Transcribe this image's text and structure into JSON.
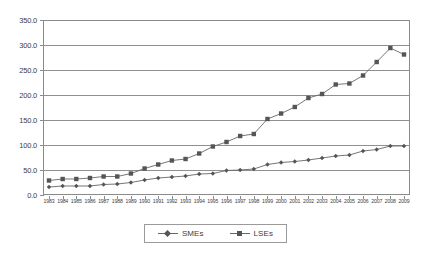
{
  "chart_data": {
    "type": "line",
    "title": "",
    "subtitle": "",
    "xlabel": "",
    "ylabel": "",
    "ylim": [
      0,
      350
    ],
    "y_ticks": [
      0,
      50,
      100,
      150,
      200,
      250,
      300,
      350
    ],
    "y_tick_labels": [
      "0.0",
      "50.0",
      "100.0",
      "150.0",
      "200.0",
      "250.0",
      "300.0",
      "350.0"
    ],
    "grid": "horizontal",
    "legend_position": "bottom-center",
    "categories": [
      "1983",
      "1984",
      "1985",
      "1986",
      "1987",
      "1988",
      "1989",
      "1990",
      "1991",
      "1992",
      "1993",
      "1994",
      "1995",
      "1996",
      "1997",
      "1998",
      "1999",
      "2000",
      "2001",
      "2002",
      "2003",
      "2004",
      "2005",
      "2006",
      "2007",
      "2008",
      "2009"
    ],
    "series": [
      {
        "name": "SMEs",
        "marker": "diamond",
        "color": "#555555",
        "values": [
          16,
          18,
          18,
          18,
          21,
          22,
          25,
          30,
          34,
          36,
          38,
          42,
          43,
          49,
          50,
          52,
          61,
          65,
          67,
          70,
          74,
          78,
          80,
          88,
          91,
          98,
          98
        ]
      },
      {
        "name": "LSEs",
        "marker": "square",
        "color": "#555555",
        "values": [
          29,
          32,
          32,
          34,
          37,
          37,
          43,
          53,
          61,
          69,
          72,
          83,
          97,
          106,
          118,
          122,
          152,
          163,
          176,
          194,
          202,
          221,
          223,
          239,
          266,
          294,
          281
        ]
      }
    ]
  },
  "legend": {
    "entries": [
      {
        "label": "SMEs",
        "marker": "diamond-marker"
      },
      {
        "label": "LSEs",
        "marker": "square-marker"
      }
    ]
  },
  "colors": {
    "line": "#666666",
    "marker": "#555555",
    "grid": "#8f8f8f",
    "frame": "#8a8a8a",
    "text": "#3d3d3d",
    "background": "#ffffff"
  }
}
